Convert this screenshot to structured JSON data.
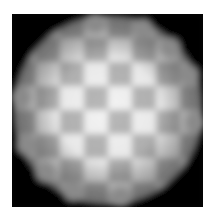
{
  "image": {
    "description": "Grayscale micrograph of a blurred checkerboard pattern seen through a circular aperture on a black background",
    "background_color": "#ffffff",
    "frame": {
      "x": 12,
      "y": 14,
      "width": 191,
      "height": 193,
      "color": "#050505"
    },
    "aperture": {
      "cx": 96,
      "cy": 96,
      "r": 94
    },
    "grid": {
      "rows": 8,
      "cols": 8,
      "cell_size": 24,
      "origin_x": 0,
      "origin_y": 0,
      "dark_parity": "even",
      "light_color": "#f4f4f4",
      "dark_color": "#b8b8b8"
    },
    "vignette": {
      "center_opacity": 0,
      "edge_color": "#303030",
      "edge_opacity": 0.55
    },
    "blur_px": 3.2
  }
}
